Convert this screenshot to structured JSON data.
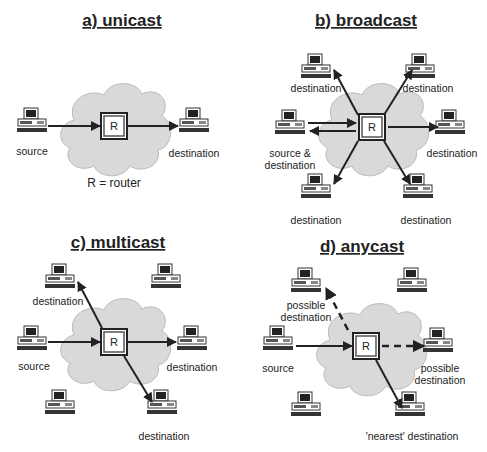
{
  "panels": {
    "a": {
      "title": "a) unicast",
      "labels": {
        "source": "source",
        "destination": "destination",
        "legend": "R = router"
      }
    },
    "b": {
      "title": "b) broadcast",
      "labels": {
        "top_left": "destination",
        "top_right": "destination",
        "source_line1": "source &",
        "source_line2": "destination",
        "right": "destination",
        "bottom_left": "destination",
        "bottom_right": "destination"
      }
    },
    "c": {
      "title": "c) multicast",
      "labels": {
        "top_left": "destination",
        "source": "source",
        "right": "destination",
        "bottom_right": "destination"
      }
    },
    "d": {
      "title": "d) anycast",
      "labels": {
        "top_left_line1": "possible",
        "top_left_line2": "destination",
        "source": "source",
        "right_line1": "possible",
        "right_line2": "destination",
        "bottom_right": "'nearest' destination"
      }
    }
  },
  "router_label": "R",
  "colors": {
    "cloud": "#d9d9d9",
    "arrow": "#222222",
    "text": "#222222"
  }
}
